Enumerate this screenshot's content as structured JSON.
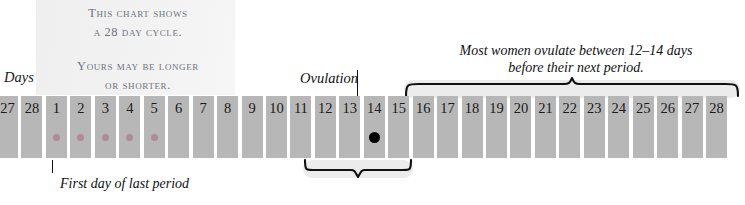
{
  "chart_data": {
    "type": "bar",
    "xlabel": "Days",
    "categories": [
      "27",
      "28",
      "1",
      "2",
      "3",
      "4",
      "5",
      "6",
      "7",
      "8",
      "9",
      "10",
      "11",
      "12",
      "13",
      "14",
      "15",
      "16",
      "17",
      "18",
      "19",
      "20",
      "21",
      "22",
      "23",
      "24",
      "25",
      "26",
      "27",
      "28"
    ],
    "values": [
      1,
      1,
      1,
      1,
      1,
      1,
      1,
      1,
      1,
      1,
      1,
      1,
      1,
      1,
      1,
      1,
      1,
      1,
      1,
      1,
      1,
      1,
      1,
      1,
      1,
      1,
      1,
      1,
      1,
      1
    ],
    "markers": [
      {
        "day": "1",
        "index": 2,
        "type": "period-dot",
        "color": "#b08a96"
      },
      {
        "day": "2",
        "index": 3,
        "type": "period-dot",
        "color": "#b08a96"
      },
      {
        "day": "3",
        "index": 4,
        "type": "period-dot",
        "color": "#b08a96"
      },
      {
        "day": "4",
        "index": 5,
        "type": "period-dot",
        "color": "#b08a96"
      },
      {
        "day": "5",
        "index": 6,
        "type": "period-dot",
        "color": "#b08a96"
      },
      {
        "day": "14",
        "index": 15,
        "type": "ovulation-dot",
        "color": "#000000"
      }
    ],
    "annotations": [
      {
        "name": "ovulation-callout",
        "text": "Ovulation",
        "points_to_day": "14"
      },
      {
        "name": "first-day-caption",
        "text": "First day of last period",
        "points_to_day": "1"
      },
      {
        "name": "fertile-window-brace",
        "spans_days": [
          "12",
          "15"
        ],
        "direction": "down"
      },
      {
        "name": "luteal-phase-brace",
        "spans_days": [
          "15",
          "28"
        ],
        "direction": "up",
        "text": "Most women ovulate between 12–14 days before their next period."
      }
    ],
    "grid": false,
    "legend": false
  },
  "note": {
    "line1": "This chart shows",
    "line2": "a 28 day cycle.",
    "line3": "Yours may be longer",
    "line4": "or shorter."
  },
  "axis": {
    "days_label": "Days"
  },
  "bars": [
    {
      "label": "27",
      "dot": "none"
    },
    {
      "label": "28",
      "dot": "none"
    },
    {
      "label": "1",
      "dot": "period"
    },
    {
      "label": "2",
      "dot": "period"
    },
    {
      "label": "3",
      "dot": "period"
    },
    {
      "label": "4",
      "dot": "period"
    },
    {
      "label": "5",
      "dot": "period"
    },
    {
      "label": "6",
      "dot": "none"
    },
    {
      "label": "7",
      "dot": "none"
    },
    {
      "label": "8",
      "dot": "none"
    },
    {
      "label": "9",
      "dot": "none"
    },
    {
      "label": "10",
      "dot": "none"
    },
    {
      "label": "11",
      "dot": "none"
    },
    {
      "label": "12",
      "dot": "none"
    },
    {
      "label": "13",
      "dot": "none"
    },
    {
      "label": "14",
      "dot": "ovulation"
    },
    {
      "label": "15",
      "dot": "none"
    },
    {
      "label": "16",
      "dot": "none"
    },
    {
      "label": "17",
      "dot": "none"
    },
    {
      "label": "18",
      "dot": "none"
    },
    {
      "label": "19",
      "dot": "none"
    },
    {
      "label": "20",
      "dot": "none"
    },
    {
      "label": "21",
      "dot": "none"
    },
    {
      "label": "22",
      "dot": "none"
    },
    {
      "label": "23",
      "dot": "none"
    },
    {
      "label": "24",
      "dot": "none"
    },
    {
      "label": "25",
      "dot": "none"
    },
    {
      "label": "26",
      "dot": "none"
    },
    {
      "label": "27",
      "dot": "none"
    },
    {
      "label": "28",
      "dot": "none"
    }
  ],
  "callouts": {
    "ovulation": "Ovulation",
    "first_day": "First day of last period",
    "right_note_line1": "Most women ovulate between 12–14 days",
    "right_note_line2": "before their next period."
  },
  "colors": {
    "bar": "#b7b7b7",
    "period_dot": "#b08a96",
    "ovulation_dot": "#000000",
    "note_panel": "#f1f1f1",
    "brace_pad": "#ececec",
    "ink": "#111111",
    "note_text": "#6f7380"
  }
}
